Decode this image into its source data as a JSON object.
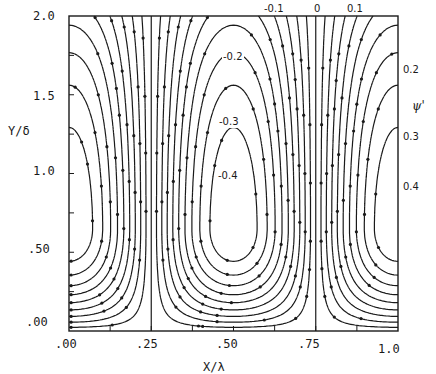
{
  "chart_data": {
    "type": "contour",
    "title": "",
    "xlabel": "X/λ",
    "ylabel": "Y/δ",
    "legend_label": "ψ'",
    "xlim": [
      0.0,
      1.0
    ],
    "ylim": [
      0.0,
      2.0
    ],
    "x_ticks": [
      ".00",
      ".25",
      ".50",
      ".75",
      "1.0"
    ],
    "y_ticks": [
      ".00",
      ".50",
      "1.0",
      "1.5",
      "2.0"
    ],
    "grid": false,
    "contour_labels": [
      {
        "text": "-0.1",
        "x": 0.61,
        "y": 2.04
      },
      {
        "text": "0",
        "x": 0.7,
        "y": 2.04
      },
      {
        "text": "0.1",
        "x": 0.79,
        "y": 2.04
      },
      {
        "text": "-0.2",
        "x": 0.5,
        "y": 1.72
      },
      {
        "text": "-0.3",
        "x": 0.5,
        "y": 1.38
      },
      {
        "text": "-0.4",
        "x": 0.5,
        "y": 1.05
      },
      {
        "text": "0.2",
        "x": 1.03,
        "y": 1.72
      },
      {
        "text": "0.3",
        "x": 1.03,
        "y": 1.36
      },
      {
        "text": "0.4",
        "x": 1.03,
        "y": 1.09
      }
    ],
    "cells": [
      {
        "sign": "negative",
        "center_x": 0.5,
        "center_y": 0.65,
        "min_level": -0.5
      },
      {
        "sign": "positive",
        "center_x": 0.0,
        "center_y": 0.65,
        "max_level": 0.5
      },
      {
        "sign": "positive",
        "center_x": 1.0,
        "center_y": 0.65,
        "max_level": 0.5
      }
    ],
    "levels": [
      -0.5,
      -0.45,
      -0.4,
      -0.35,
      -0.3,
      -0.25,
      -0.2,
      -0.15,
      -0.1,
      -0.05,
      0,
      0.05,
      0.1,
      0.15,
      0.2,
      0.25,
      0.3,
      0.35,
      0.4,
      0.45,
      0.5
    ],
    "separatrix_x": [
      0.25,
      0.75
    ],
    "markers": "dots along streamlines"
  },
  "labels": {
    "y_axis": "Y/δ",
    "x_axis": "X/λ",
    "psi": "ψ'",
    "y_ticks": [
      "2.0",
      "1.5",
      "1.0",
      ".50",
      ".00"
    ],
    "x_ticks": [
      ".00",
      ".25",
      ".50",
      ".75",
      "1.0"
    ],
    "top": [
      "-0.1",
      "0",
      "0.1"
    ],
    "inner": [
      "-0.2",
      "-0.3",
      "-0.4"
    ],
    "right": [
      "0.2",
      "0.3",
      "0.4"
    ]
  }
}
